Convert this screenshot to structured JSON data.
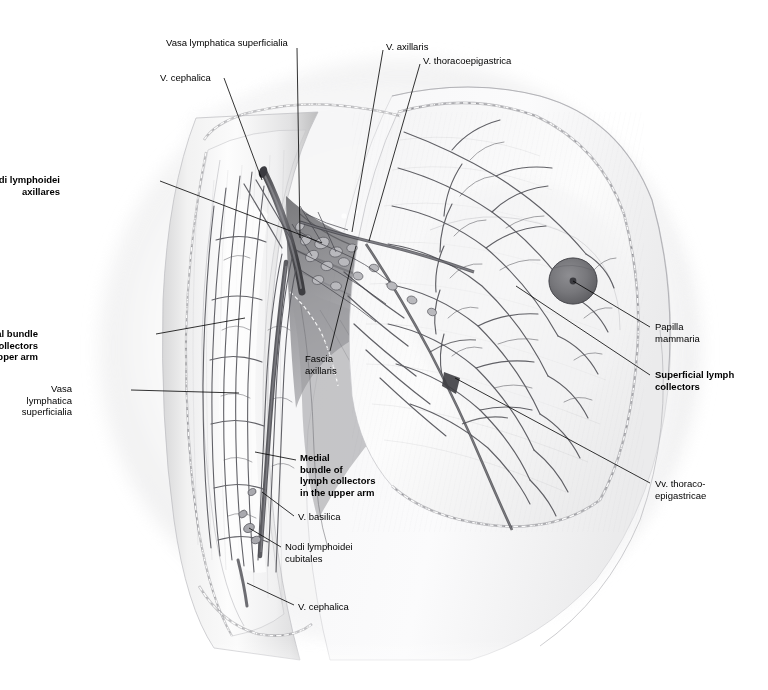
{
  "figure": {
    "style": "grayscale anatomical illustration",
    "background_color": "#ffffff",
    "ink_color": "#000000"
  },
  "labels": [
    {
      "id": "vasa-lymphatica-superficialia-top",
      "text": "Vasa lymphatica superficialia",
      "bold": false,
      "align": "left",
      "x": 166,
      "y": 37,
      "leader": [
        [
          297,
          48
        ],
        [
          300,
          238
        ]
      ]
    },
    {
      "id": "v-axillaris",
      "text": "V. axillaris",
      "bold": false,
      "align": "left",
      "x": 386,
      "y": 41,
      "leader": [
        [
          383,
          50
        ],
        [
          352,
          232
        ]
      ]
    },
    {
      "id": "v-thoracoepigastrica",
      "text": "V. thoracoepigastrica",
      "bold": false,
      "align": "left",
      "x": 423,
      "y": 55,
      "leader": [
        [
          420,
          64
        ],
        [
          369,
          241
        ]
      ]
    },
    {
      "id": "v-cephalica-top",
      "text": "V. cephalica",
      "bold": false,
      "align": "left",
      "x": 160,
      "y": 72,
      "leader": [
        [
          224,
          78
        ],
        [
          262,
          180
        ]
      ]
    },
    {
      "id": "nodi-lymphoidei-axillares",
      "text": "Nodi lymphoidei\naxillares",
      "bold": true,
      "align": "right",
      "x": 60,
      "y": 174,
      "leader": [
        [
          160,
          181
        ],
        [
          322,
          243
        ]
      ]
    },
    {
      "id": "dorsolateral-bundle",
      "text": "Dorsolateral bundle\nof lymph collectors\nin the upper arm",
      "bold": true,
      "align": "right",
      "x": 38,
      "y": 328,
      "leader": [
        [
          156,
          334
        ],
        [
          245,
          318
        ]
      ]
    },
    {
      "id": "vasa-lymphatica-superficialia-arm",
      "text": "Vasa\nlymphatica\nsuperficialia",
      "bold": false,
      "align": "right",
      "x": 72,
      "y": 383,
      "leader": [
        [
          131,
          390
        ],
        [
          239,
          393
        ]
      ]
    },
    {
      "id": "fascia-axillaris",
      "text": "Fascia\naxillaris",
      "bold": false,
      "align": "left",
      "x": 305,
      "y": 353,
      "leader": [
        [
          330,
          351
        ],
        [
          356,
          246
        ]
      ]
    },
    {
      "id": "medial-bundle",
      "text": "Medial\nbundle of\nlymph collectors\nin the upper arm",
      "bold": true,
      "align": "left",
      "x": 300,
      "y": 452,
      "leader": [
        [
          296,
          460
        ],
        [
          255,
          452
        ]
      ]
    },
    {
      "id": "v-basilica",
      "text": "V. basilica",
      "bold": false,
      "align": "left",
      "x": 298,
      "y": 511,
      "leader": [
        [
          294,
          516
        ],
        [
          262,
          492
        ]
      ]
    },
    {
      "id": "nodi-lymphoidei-cubitales",
      "text": "Nodi lymphoidei\ncubitales",
      "bold": false,
      "align": "left",
      "x": 285,
      "y": 541,
      "leader": [
        [
          281,
          547
        ],
        [
          249,
          528
        ]
      ]
    },
    {
      "id": "v-cephalica-bottom",
      "text": "V. cephalica",
      "bold": false,
      "align": "left",
      "x": 298,
      "y": 601,
      "leader": [
        [
          294,
          605
        ],
        [
          247,
          583
        ]
      ]
    },
    {
      "id": "papilla-mammaria",
      "text": "Papilla\nmammaria",
      "bold": false,
      "align": "left",
      "x": 655,
      "y": 321,
      "leader": [
        [
          650,
          327
        ],
        [
          573,
          281
        ]
      ]
    },
    {
      "id": "superficial-lymph-collectors",
      "text": "Superficial lymph\ncollectors",
      "bold": true,
      "align": "left",
      "x": 655,
      "y": 369,
      "leader": [
        [
          650,
          375
        ],
        [
          516,
          286
        ]
      ]
    },
    {
      "id": "vv-thoraco-epigastricae",
      "text": "Vv. thoraco-\nepigastricae",
      "bold": false,
      "align": "left",
      "x": 655,
      "y": 478,
      "leader": [
        [
          650,
          483
        ],
        [
          455,
          378
        ]
      ]
    }
  ],
  "structures": [
    {
      "name": "upper-arm",
      "kind": "limb"
    },
    {
      "name": "axilla",
      "kind": "region"
    },
    {
      "name": "thoracic-wall",
      "kind": "region"
    },
    {
      "name": "breast",
      "kind": "region"
    },
    {
      "name": "nipple-areola",
      "kind": "landmark"
    },
    {
      "name": "axillary-lymph-node-cluster",
      "kind": "lymph-nodes"
    },
    {
      "name": "cubital-lymph-nodes",
      "kind": "lymph-nodes"
    },
    {
      "name": "skin-flap-cut-edge",
      "kind": "dissection-edge"
    }
  ]
}
